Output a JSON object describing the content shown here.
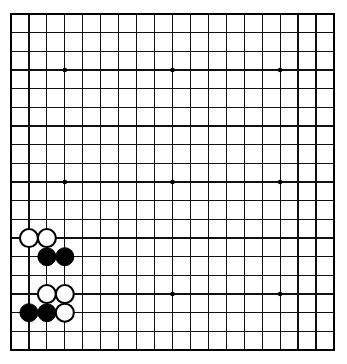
{
  "board": {
    "title": "Go board diagram",
    "size": 19,
    "columns": 19,
    "rows": 19,
    "origin_x": 11,
    "origin_y": 14,
    "spacing_x": 17.94,
    "spacing_y": 18.67,
    "stone_radius": 9.0,
    "background_color": "#ffffff",
    "line_color": "#111111",
    "border_color": "#000000",
    "black_color": "#000000",
    "white_color": "#ffffff",
    "star_radius": 2.3,
    "star_points": [
      {
        "col": 4,
        "row": 4
      },
      {
        "col": 10,
        "row": 4
      },
      {
        "col": 16,
        "row": 4
      },
      {
        "col": 4,
        "row": 10
      },
      {
        "col": 10,
        "row": 10
      },
      {
        "col": 16,
        "row": 10
      },
      {
        "col": 4,
        "row": 16
      },
      {
        "col": 10,
        "row": 16
      },
      {
        "col": 16,
        "row": 16
      }
    ],
    "stones": [
      {
        "col": 2,
        "row": 13,
        "color": "white"
      },
      {
        "col": 3,
        "row": 13,
        "color": "white"
      },
      {
        "col": 3,
        "row": 14,
        "color": "black"
      },
      {
        "col": 4,
        "row": 14,
        "color": "black"
      },
      {
        "col": 3,
        "row": 16,
        "color": "white"
      },
      {
        "col": 4,
        "row": 16,
        "color": "white"
      },
      {
        "col": 2,
        "row": 17,
        "color": "black"
      },
      {
        "col": 3,
        "row": 17,
        "color": "black"
      },
      {
        "col": 4,
        "row": 17,
        "color": "white"
      }
    ]
  },
  "chart_data": {
    "type": "table",
    "xlabel": "column (1-19, left to right)",
    "ylabel": "row (1-19, top to bottom)",
    "grid": true,
    "legend": [
      {
        "name": "Black stone",
        "color": "#000000",
        "count": 4
      },
      {
        "name": "White stone",
        "color": "#ffffff",
        "count": 5
      }
    ],
    "series": [
      {
        "name": "Black stone",
        "points": [
          {
            "col": 3,
            "row": 14
          },
          {
            "col": 4,
            "row": 14
          },
          {
            "col": 2,
            "row": 17
          },
          {
            "col": 3,
            "row": 17
          }
        ]
      },
      {
        "name": "White stone",
        "points": [
          {
            "col": 2,
            "row": 13
          },
          {
            "col": 3,
            "row": 13
          },
          {
            "col": 3,
            "row": 16
          },
          {
            "col": 4,
            "row": 16
          },
          {
            "col": 4,
            "row": 17
          }
        ]
      },
      {
        "name": "Star point",
        "points": [
          {
            "col": 4,
            "row": 4
          },
          {
            "col": 10,
            "row": 4
          },
          {
            "col": 16,
            "row": 4
          },
          {
            "col": 4,
            "row": 10
          },
          {
            "col": 10,
            "row": 10
          },
          {
            "col": 16,
            "row": 10
          },
          {
            "col": 4,
            "row": 16
          },
          {
            "col": 10,
            "row": 16
          },
          {
            "col": 16,
            "row": 16
          }
        ]
      }
    ]
  }
}
